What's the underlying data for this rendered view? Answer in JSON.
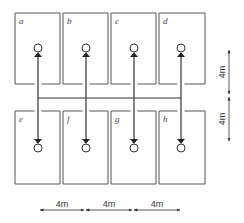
{
  "diagram": {
    "rooms_top": [
      {
        "label": "a",
        "x": 15,
        "y": 13,
        "w": 45,
        "h": 71,
        "door_x": 38
      },
      {
        "label": "b",
        "x": 63,
        "y": 13,
        "w": 45,
        "h": 71,
        "door_x": 86
      },
      {
        "label": "c",
        "x": 111,
        "y": 13,
        "w": 45,
        "h": 71,
        "door_x": 134
      },
      {
        "label": "d",
        "x": 159,
        "y": 13,
        "w": 46,
        "h": 71,
        "door_x": 181
      }
    ],
    "rooms_bottom": [
      {
        "label": "e",
        "x": 15,
        "y": 111,
        "w": 45,
        "h": 73,
        "door_x": 38
      },
      {
        "label": "f",
        "x": 63,
        "y": 111,
        "w": 45,
        "h": 73,
        "door_x": 86
      },
      {
        "label": "g",
        "x": 111,
        "y": 111,
        "w": 45,
        "h": 73,
        "door_x": 134
      },
      {
        "label": "h",
        "x": 159,
        "y": 111,
        "w": 46,
        "h": 73,
        "door_x": 181
      }
    ],
    "corridor": {
      "y": 98,
      "x1": 38,
      "x2": 181
    },
    "nodes_top_y": 48,
    "nodes_bottom_y": 148,
    "node_radius": 4,
    "dimensions": {
      "horizontal": {
        "y": 210,
        "segments": [
          {
            "x1": 40,
            "x2": 84,
            "label": "4m"
          },
          {
            "x1": 86,
            "x2": 132,
            "label": "4m"
          },
          {
            "x1": 134,
            "x2": 180,
            "label": "4m"
          }
        ]
      },
      "vertical": {
        "x": 229,
        "segments": [
          {
            "y1": 50,
            "y2": 94,
            "label": "4m"
          },
          {
            "y1": 97,
            "y2": 141,
            "label": "4m"
          }
        ]
      }
    },
    "line_color": "#333333",
    "room_line_color": "#555555"
  }
}
